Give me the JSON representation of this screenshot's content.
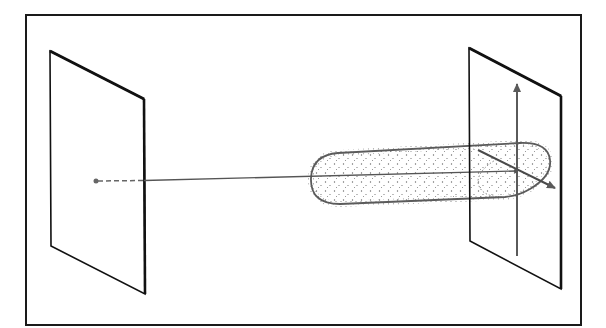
{
  "diagram": {
    "type": "3d-schematic",
    "colors": {
      "frame": "#1a1a1a",
      "plane_edge": "#111111",
      "beam_line": "#555555",
      "stipple": "#6a6a6a",
      "arrow": "#5a5a5a",
      "background": "#ffffff"
    },
    "elements": {
      "frame": {
        "x": 26,
        "y": 15,
        "w": 555,
        "h": 310
      },
      "source_plane": {
        "corners": [
          [
            50,
            51
          ],
          [
            144,
            99
          ],
          [
            145,
            294
          ],
          [
            51,
            246
          ]
        ]
      },
      "source_point": {
        "x": 96,
        "y": 181
      },
      "target_plane": {
        "corners": [
          [
            469,
            48
          ],
          [
            561,
            96
          ],
          [
            561,
            289
          ],
          [
            470,
            241
          ]
        ]
      },
      "beam_tube": {
        "left_tip": [
          311,
          178
        ],
        "right_end": [
          550,
          165
        ],
        "radius": 26
      },
      "axis_vertical": {
        "x": 517,
        "y_top": 82,
        "y_bottom": 256
      },
      "axis_diagonal": {
        "from": [
          478,
          150
        ],
        "to": [
          555,
          188
        ]
      },
      "target_point": {
        "x": 516,
        "y": 171
      }
    },
    "labels": []
  }
}
